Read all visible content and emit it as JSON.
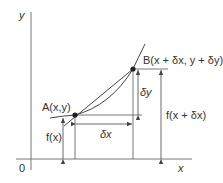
{
  "diagram": {
    "type": "derivative-secant-illustration",
    "axes": {
      "x_label": "x",
      "y_label": "y",
      "origin_label": "0"
    },
    "points": {
      "A": {
        "label": "A(x,y)"
      },
      "B": {
        "label": "B(x + δx, y + δy)"
      }
    },
    "measures": {
      "fx": "f(x)",
      "fx_dx": "f(x + δx)",
      "dx": "δx",
      "dy": "δy"
    },
    "colors": {
      "line": "#555555",
      "text": "#333333",
      "point": "#222222"
    }
  }
}
